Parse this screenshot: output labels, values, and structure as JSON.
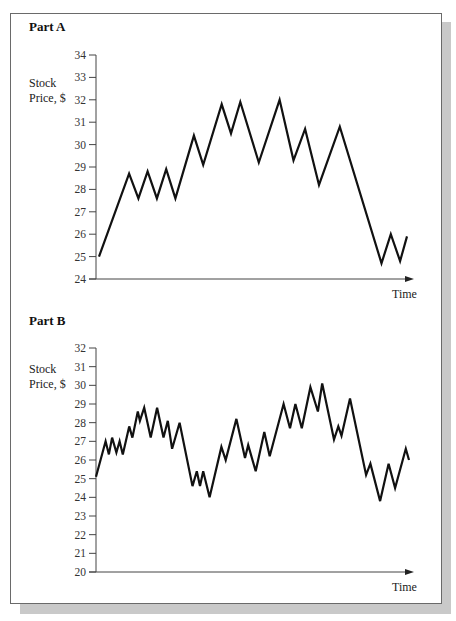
{
  "figure": {
    "part_a": {
      "title": "Part A",
      "ylabel_line1": "Stock",
      "ylabel_line2": "Price, $",
      "xlabel": "Time"
    },
    "part_b": {
      "title": "Part B",
      "ylabel_line1": "Stock",
      "ylabel_line2": "Price, $",
      "xlabel": "Time"
    }
  },
  "chart_data": [
    {
      "type": "line",
      "title": "Part A",
      "xlabel": "Time",
      "ylabel": "Stock Price, $",
      "ylim": [
        24,
        34
      ],
      "yticks": [
        24,
        25,
        26,
        27,
        28,
        29,
        30,
        31,
        32,
        33,
        34
      ],
      "grid": false,
      "x": [
        0,
        1.3,
        1.7,
        2.1,
        2.5,
        2.9,
        3.3,
        4.1,
        4.5,
        5.3,
        5.7,
        6.1,
        6.9,
        7.8,
        8.4,
        8.9,
        9.5,
        10.4,
        12.2,
        12.6,
        13.0,
        13.3
      ],
      "values": [
        25.0,
        28.7,
        27.6,
        28.8,
        27.6,
        28.9,
        27.6,
        30.4,
        29.1,
        31.8,
        30.5,
        31.9,
        29.2,
        32.0,
        29.3,
        30.7,
        28.2,
        30.8,
        24.7,
        26.0,
        24.8,
        25.9
      ]
    },
    {
      "type": "line",
      "title": "Part B",
      "xlabel": "Time",
      "ylabel": "Stock Price, $",
      "ylim": [
        20,
        32
      ],
      "yticks": [
        20,
        21,
        22,
        23,
        24,
        25,
        26,
        27,
        28,
        29,
        30,
        31,
        32
      ],
      "grid": false,
      "x": [
        0,
        0.9,
        1.2,
        1.5,
        1.9,
        2.2,
        2.5,
        3.1,
        3.4,
        3.9,
        4.1,
        4.5,
        5.1,
        5.7,
        6.3,
        6.7,
        7.1,
        7.8,
        9.0,
        9.4,
        9.7,
        10.0,
        10.6,
        11.7,
        12.1,
        13.1,
        13.9,
        14.2,
        14.9,
        15.7,
        16.2,
        17.5,
        18.1,
        18.6,
        19.2,
        20.0,
        20.7,
        21.1,
        22.2,
        22.6,
        22.9,
        23.7,
        25.2,
        25.6,
        26.5,
        27.3,
        27.9,
        28.9,
        29.2
      ],
      "values": [
        25.1,
        27.0,
        26.3,
        27.2,
        26.4,
        27.0,
        26.3,
        27.8,
        27.2,
        28.6,
        28.1,
        28.8,
        27.2,
        28.8,
        27.2,
        28.1,
        26.6,
        28.0,
        24.6,
        25.4,
        24.6,
        25.4,
        24.0,
        26.7,
        26.0,
        28.2,
        26.1,
        26.8,
        25.4,
        27.5,
        26.2,
        29.0,
        27.7,
        29.0,
        27.7,
        29.9,
        28.6,
        30.1,
        27.1,
        27.8,
        27.3,
        29.3,
        25.2,
        25.8,
        23.8,
        25.8,
        24.5,
        26.6,
        26.0
      ]
    }
  ]
}
